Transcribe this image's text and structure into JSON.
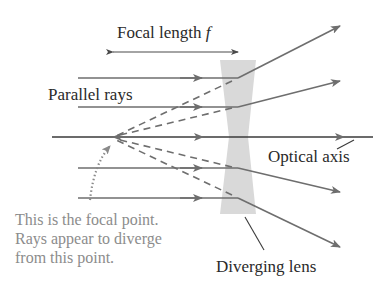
{
  "diagram": {
    "labels": {
      "focal_length": "Focal length",
      "focal_length_symbol": "f",
      "parallel_rays": "Parallel rays",
      "optical_axis": "Optical axis",
      "diverging_lens": "Diverging lens",
      "focal_point_note": [
        "This is the focal point.",
        "Rays appear to diverge",
        "from this point."
      ]
    },
    "colors": {
      "ray": "#6e6e6e",
      "lens": "#d6d6d6",
      "axis": "#3a3a3a",
      "text_dark": "#2a2a2a",
      "text_note": "#8c8c8c"
    },
    "geometry": {
      "focal_point": [
        113,
        137
      ],
      "lens_center_x": 238,
      "optical_axis_y": 137,
      "incoming_rays_y": [
        78,
        107,
        168,
        198
      ]
    }
  }
}
